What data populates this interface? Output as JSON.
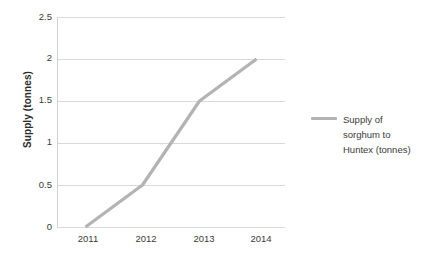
{
  "chart_data": {
    "type": "line",
    "title": "",
    "subtitle": "",
    "xlabel": "",
    "ylabel": "Supply (tonnes)",
    "categories": [
      "2011",
      "2012",
      "2013",
      "2014"
    ],
    "x": [
      2011,
      2012,
      2013,
      2014
    ],
    "series": [
      {
        "name": "Supply of sorghum to Huntex (tonnes)",
        "values": [
          0,
          0.5,
          1.5,
          2
        ],
        "color": "#b3b3b3"
      }
    ],
    "ylim": [
      0,
      2.5
    ],
    "y_ticks": [
      "0",
      "0.5",
      "1",
      "1.5",
      "2",
      "2.5"
    ],
    "y_tick_values": [
      0,
      0.5,
      1,
      1.5,
      2,
      2.5
    ],
    "x_tick_labels": [
      "2011",
      "2012",
      "2013",
      "2014"
    ],
    "grid": "horizontal",
    "gridline_color": "#d9d9d9",
    "axis_color": "#d0d0d0",
    "legend_position": "right",
    "legend": [
      {
        "label_lines": [
          "Supply of",
          "sorghum to",
          "Huntex (tonnes)"
        ],
        "color": "#b3b3b3"
      }
    ]
  },
  "axis": {
    "y_title": "Supply (tonnes)"
  },
  "legend_block": {
    "line1": "Supply of",
    "line2": "sorghum to",
    "line3": "Huntex (tonnes)"
  },
  "y_labels": {
    "t0": "0",
    "t1": "0.5",
    "t2": "1",
    "t3": "1.5",
    "t4": "2",
    "t5": "2.5"
  },
  "x_labels": {
    "c0": "2011",
    "c1": "2012",
    "c2": "2013",
    "c3": "2014"
  }
}
